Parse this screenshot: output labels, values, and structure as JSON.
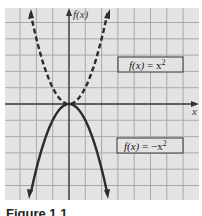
{
  "figure": {
    "background": "#e3e3e3",
    "grid_color": "#a9a9a9",
    "axis_color": "#333333",
    "curve_color": "#2b2b2b",
    "x_axis_label": "x",
    "y_axis_label": "f(x)",
    "caption": "Figure 1.1"
  },
  "chart_data": {
    "type": "line",
    "title": "",
    "xlabel": "x",
    "ylabel": "f(x)",
    "grid": true,
    "xlim": [
      -4,
      8
    ],
    "ylim": [
      -6,
      6
    ],
    "series": [
      {
        "name": "f(x) = x^2",
        "style": "dashed",
        "x": [
          -2.3,
          -2,
          -1.5,
          -1,
          -0.5,
          0,
          0.5,
          1,
          1.5,
          2,
          2.5
        ],
        "y": [
          5.3,
          4,
          2.25,
          1,
          0.25,
          0,
          0.25,
          1,
          2.25,
          4,
          5.3
        ]
      },
      {
        "name": "f(x) = -x^2",
        "style": "solid",
        "x": [
          -2.4,
          -2,
          -1.5,
          -1,
          -0.5,
          0,
          0.5,
          1,
          1.5,
          2,
          2.4
        ],
        "y": [
          -5.7,
          -4,
          -2.25,
          -1,
          -0.25,
          0,
          -0.25,
          -1,
          -2.25,
          -4,
          -5.7
        ]
      }
    ],
    "annotations": [
      {
        "text": "f(x) = x²",
        "position": "upper right, boxed"
      },
      {
        "text": "f(x) = −x²",
        "position": "lower right, boxed"
      }
    ]
  },
  "labels": {
    "upper": {
      "fx": "f(x)",
      "eq": " = x",
      "exp": "2"
    },
    "lower": {
      "fx": "f(x)",
      "eq": " = −x",
      "exp": "2"
    }
  }
}
